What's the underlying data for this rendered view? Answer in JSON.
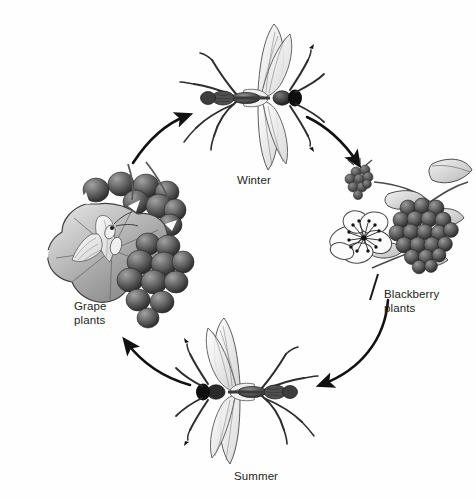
{
  "diagram": {
    "type": "cycle",
    "direction": "clockwise",
    "background_color": "#fefefe",
    "ink_color": "#231f20",
    "labels": {
      "winter": "Winter",
      "summer": "Summer",
      "grape": "Grape\nplants",
      "blackberry": "Blackberry\nplants"
    },
    "nodes": [
      {
        "id": "winter-insect",
        "label": "Winter",
        "role": "adult insect, winter generation",
        "position": "top"
      },
      {
        "id": "blackberry-plants",
        "label": "Blackberry plants",
        "role": "host plant with flower, unripe and ripe berries",
        "position": "right"
      },
      {
        "id": "summer-insect",
        "label": "Summer",
        "role": "adult insect, summer generation",
        "position": "bottom"
      },
      {
        "id": "grape-plants",
        "label": "Grape plants",
        "role": "host plant with leaf, pale insect and grape cluster",
        "position": "left"
      }
    ],
    "arrows": [
      {
        "id": "arrow-winter-to-blackberry",
        "from": "winter-insect",
        "to": "blackberry-plants"
      },
      {
        "id": "arrow-blackberry-to-summer",
        "from": "blackberry-plants",
        "to": "summer-insect"
      },
      {
        "id": "arrow-summer-to-grape",
        "from": "summer-insect",
        "to": "grape-plants"
      },
      {
        "id": "arrow-grape-to-winter",
        "from": "grape-plants",
        "to": "winter-insect"
      }
    ]
  }
}
